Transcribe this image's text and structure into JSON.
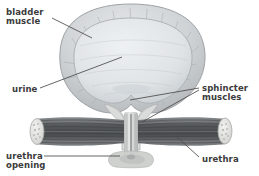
{
  "figure": {
    "background_color": "#ffffff",
    "label_color": "#3b3b3b",
    "width": 259,
    "height": 176
  },
  "labels": {
    "bladder_muscle": "bladder\nmuscle",
    "urine": "urine",
    "urethra_opening": "urethra\nopening",
    "sphincter_muscles": "sphincter\nmuscles",
    "urethra": "urethra"
  },
  "parts": {
    "bladder_wall": {
      "name": "bladder muscle wall",
      "color": "#c9ccce"
    },
    "bladder_cavity": {
      "name": "urine filled cavity",
      "color": "#dfe3e6"
    },
    "sphincter_band": {
      "name": "sphincter muscle band",
      "color": "#5c5f61"
    },
    "sphincter_cap": {
      "name": "cut muscle end cap",
      "color": "#e4e4e2"
    },
    "urethra_tube": {
      "name": "urethra",
      "color": "#d2d4d2"
    },
    "urethra_opening": {
      "name": "urethra opening",
      "color": "#c2c4c2"
    }
  },
  "leaders": [
    {
      "name": "bladder-muscle-leader",
      "from": [
        52,
        18
      ],
      "to": [
        92,
        38
      ]
    },
    {
      "name": "urine-leader",
      "from": [
        40,
        88
      ],
      "to": [
        122,
        57
      ]
    },
    {
      "name": "urethra-opening-leader",
      "from": [
        44,
        156
      ],
      "to": [
        122,
        156
      ]
    },
    {
      "name": "sphincter-upper-leader",
      "from": [
        199,
        88
      ],
      "to": [
        130,
        100
      ]
    },
    {
      "name": "sphincter-lower-leader",
      "from": [
        199,
        90
      ],
      "to": [
        140,
        122
      ]
    },
    {
      "name": "urethra-leader",
      "from": [
        199,
        157
      ],
      "to": [
        176,
        136
      ]
    }
  ]
}
